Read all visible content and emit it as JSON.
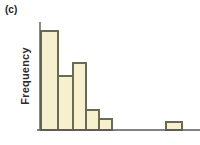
{
  "figure": {
    "panel_label": "(c)",
    "ylabel": "Frequency",
    "xlabel": "",
    "background_color": "#ffffff",
    "bar_fill_color": "#f7f0cf",
    "bar_edge_color": "#6b6a52",
    "axis_color": "#59595b"
  },
  "chart_data": {
    "type": "bar",
    "title": "",
    "subtitle": "",
    "xlabel": "",
    "ylabel": "Frequency",
    "legend": [],
    "grid": false,
    "axis_ticks_shown": false,
    "categories": [
      "1",
      "2",
      "3",
      "4",
      "5",
      "6",
      "7",
      "8",
      "9",
      "10",
      "11"
    ],
    "values": [
      99,
      54,
      67,
      20,
      11,
      0,
      0,
      0,
      0,
      8,
      0
    ],
    "xlim": [
      0,
      11
    ],
    "ylim": [
      0,
      108
    ],
    "bars": [
      {
        "index": 1,
        "x_left": 41,
        "x_right": 58,
        "top_y": 31,
        "height_px": 99,
        "value": 99
      },
      {
        "index": 2,
        "x_left": 58,
        "x_right": 73,
        "top_y": 76,
        "height_px": 54,
        "value": 54
      },
      {
        "index": 3,
        "x_left": 73,
        "x_right": 86,
        "top_y": 63,
        "height_px": 67,
        "value": 67
      },
      {
        "index": 4,
        "x_left": 86,
        "x_right": 99,
        "top_y": 110,
        "height_px": 20,
        "value": 20
      },
      {
        "index": 5,
        "x_left": 99,
        "x_right": 112,
        "top_y": 119,
        "height_px": 11,
        "value": 11
      },
      {
        "index": 6,
        "x_left": 166,
        "x_right": 182,
        "top_y": 122,
        "height_px": 8,
        "value": 8
      }
    ],
    "axes": {
      "y_axis_x": 40,
      "y_axis_top": 22,
      "baseline_y": 130,
      "baseline_x_start": 37,
      "baseline_x_end": 200
    }
  }
}
